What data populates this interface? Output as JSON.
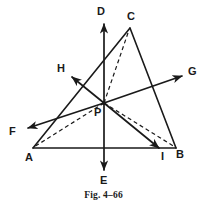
{
  "figure": {
    "caption": "Fig. 4–66",
    "line_color": "#1a1a1a",
    "background_color": "#ffffff",
    "width": 207,
    "height": 217
  },
  "labels": {
    "A": "A",
    "B": "B",
    "C": "C",
    "D": "D",
    "E": "E",
    "F": "F",
    "G": "G",
    "H": "H",
    "I": "I",
    "P": "P"
  },
  "geometry": {
    "points": {
      "A": {
        "x": 33,
        "y": 148
      },
      "B": {
        "x": 176,
        "y": 148
      },
      "C": {
        "x": 130,
        "y": 28
      },
      "P": {
        "x": 104,
        "y": 103
      },
      "D_tip": {
        "x": 104,
        "y": 22
      },
      "E_tip": {
        "x": 104,
        "y": 172
      },
      "F_tip": {
        "x": 25,
        "y": 128
      },
      "G_tip": {
        "x": 184,
        "y": 75
      },
      "H_tip": {
        "x": 70,
        "y": 76
      },
      "I_tip": {
        "x": 161,
        "y": 150
      }
    },
    "solid_segments": [
      {
        "name": "side-AB",
        "from": "A",
        "to": "B"
      },
      {
        "name": "side-AC",
        "from": "A",
        "to": "C"
      },
      {
        "name": "side-CB",
        "from": "C",
        "to": "B"
      },
      {
        "name": "vector-PD",
        "from": "P",
        "to": "D_tip"
      },
      {
        "name": "vector-PE",
        "from": "P",
        "to": "E_tip"
      },
      {
        "name": "vector-PF",
        "from": "P",
        "to": "F_tip"
      },
      {
        "name": "vector-PG",
        "from": "P",
        "to": "G_tip"
      },
      {
        "name": "vector-PH",
        "from": "P",
        "to": "H_tip"
      },
      {
        "name": "vector-PI",
        "from": "P",
        "to": "I_tip"
      }
    ],
    "dashed_segments": [
      {
        "name": "dashed-PC",
        "from": "P",
        "to": "C"
      },
      {
        "name": "dashed-PB",
        "from": "P",
        "to": "B"
      },
      {
        "name": "dashed-PA",
        "from": "P",
        "to": "A"
      }
    ]
  },
  "label_positions": {
    "A": {
      "left": 25,
      "top": 152
    },
    "B": {
      "left": 176,
      "top": 149
    },
    "C": {
      "left": 127,
      "top": 11
    },
    "D": {
      "left": 97,
      "top": 6
    },
    "E": {
      "left": 100,
      "top": 175
    },
    "F": {
      "left": 9,
      "top": 126
    },
    "G": {
      "left": 188,
      "top": 66
    },
    "H": {
      "left": 57,
      "top": 63
    },
    "I": {
      "left": 161,
      "top": 151
    },
    "P": {
      "left": 94,
      "top": 107
    }
  }
}
